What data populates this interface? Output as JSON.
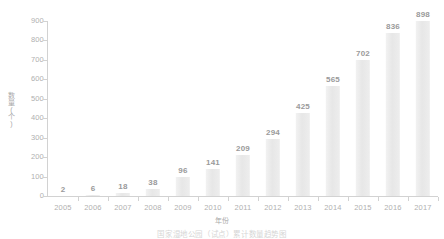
{
  "chart_data": {
    "type": "bar",
    "title": "",
    "caption": "国家湿地公园（试点）累计数量趋势图",
    "xlabel": "年份",
    "ylabel": "数量(个)",
    "categories": [
      "2005",
      "2006",
      "2007",
      "2008",
      "2009",
      "2010",
      "2011",
      "2012",
      "2013",
      "2014",
      "2015",
      "2016",
      "2017"
    ],
    "values": [
      2,
      6,
      18,
      38,
      96,
      141,
      209,
      294,
      425,
      565,
      702,
      836,
      898
    ],
    "y_ticks": [
      "0",
      "100",
      "200",
      "300",
      "400",
      "500",
      "600",
      "700",
      "800",
      "900"
    ],
    "ylim": [
      0,
      900
    ],
    "grid": false,
    "legend": false,
    "bar_color": "#ebebeb",
    "label_color": "#9a9a9a",
    "axis_color": "#d2d2d2",
    "tick_label_color": "#b0b0b0"
  }
}
